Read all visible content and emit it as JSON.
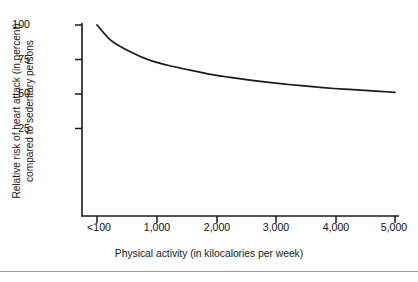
{
  "chart_data": {
    "type": "line",
    "title": "",
    "xlabel": "Physical activity (in kilocalories per week)",
    "ylabel": "Relative risk of heart attack (in percent) compared to sedentary persons",
    "ylabel_lines": [
      "Relative risk of heart attack (in percent)",
      "compared to sedentary persons"
    ],
    "x_tick_labels": [
      "<100",
      "1,000",
      "2,000",
      "3,000",
      "4,000",
      "5,000"
    ],
    "x_tick_values": [
      100,
      1000,
      2000,
      3000,
      4000,
      5000
    ],
    "y_tick_labels": [
      "25",
      "50",
      "75",
      "100"
    ],
    "y_tick_values": [
      25,
      50,
      75,
      100
    ],
    "xlim": [
      100,
      5000
    ],
    "ylim": [
      0,
      100
    ],
    "grid": false,
    "legend": null,
    "series": [
      {
        "name": "Relative risk of heart attack",
        "x": [
          100,
          300,
          500,
          750,
          1000,
          1250,
          1500,
          1750,
          2000,
          2250,
          2500,
          2750,
          3000,
          3250,
          3500,
          3750,
          4000,
          4250,
          4500,
          4750,
          5000
        ],
        "values": [
          100,
          90,
          84,
          78.5,
          74,
          71,
          68.5,
          66.2,
          64,
          62.3,
          60.8,
          59.3,
          58,
          56.9,
          55.9,
          54.9,
          54,
          53.3,
          52.6,
          51.9,
          51.2
        ]
      }
    ],
    "key_points": {
      "x": [
        100,
        1000,
        2000,
        3000,
        4000,
        5000
      ],
      "values": [
        100,
        74,
        64,
        58,
        54,
        51
      ]
    },
    "line_color": "#1a1a1a",
    "axis_color": "#1a1a1a",
    "background_color": "#ffffff"
  },
  "figure": {
    "bottom_rule_color": "#9a9a9a"
  }
}
